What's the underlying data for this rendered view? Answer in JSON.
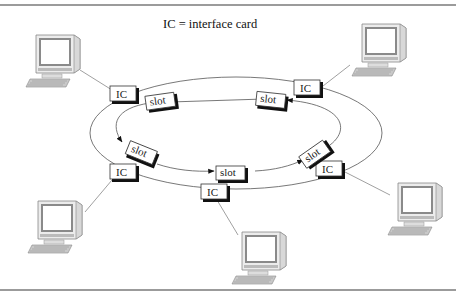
{
  "diagram": {
    "title": "IC = interface card",
    "ic_label": "IC",
    "slot_label": "slot",
    "colors": {
      "line": "#555555",
      "rule": "#7a7a7a",
      "box_shadow": "#111111",
      "screen": "#ffffff",
      "monitor": "#e8e8e8"
    },
    "computers": [
      {
        "id": "top-left"
      },
      {
        "id": "top-right"
      },
      {
        "id": "bottom-left"
      },
      {
        "id": "bottom-center"
      },
      {
        "id": "bottom-right"
      }
    ],
    "interface_cards": [
      {
        "id": "ic-top-left",
        "label": "IC"
      },
      {
        "id": "ic-top-right",
        "label": "IC"
      },
      {
        "id": "ic-left",
        "label": "IC"
      },
      {
        "id": "ic-bottom",
        "label": "IC"
      },
      {
        "id": "ic-right",
        "label": "IC"
      }
    ],
    "slots": [
      {
        "id": "slot-top-left",
        "label": "slot"
      },
      {
        "id": "slot-top-right",
        "label": "slot"
      },
      {
        "id": "slot-left",
        "label": "slot"
      },
      {
        "id": "slot-bottom",
        "label": "slot"
      },
      {
        "id": "slot-right",
        "label": "slot"
      }
    ],
    "ring_direction": "counter-clockwise on top, left-to-right on bottom"
  }
}
